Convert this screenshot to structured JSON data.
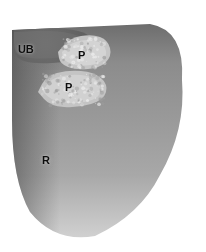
{
  "figure": {
    "domain": "natural-image",
    "kind": "anatomical-histology-section",
    "orientation": "sagittal",
    "color_mode": "grayscale",
    "width_px": 206,
    "height_px": 252,
    "background_color": "#ffffff",
    "border": "none",
    "palette": {
      "background": "#ffffff",
      "soft_tissue_dark": "#5a5a5a",
      "soft_tissue_mid": "#8e8e8e",
      "soft_tissue_light": "#c4c4c4",
      "highlight": "#f2f2f2",
      "cavity_black": "#17181a",
      "label_text": "#0d0d0d"
    },
    "labels": [
      {
        "id": "ub",
        "text": "UB",
        "meaning": "urinary bladder",
        "x_pct": 8.7,
        "y_pct": 17.5,
        "font_size_px": 11
      },
      {
        "id": "p-upper",
        "text": "P",
        "meaning": "prostate (upper zone)",
        "x_pct": 37.9,
        "y_pct": 19.8,
        "font_size_px": 11
      },
      {
        "id": "p-lower",
        "text": "P",
        "meaning": "prostate (lower zone)",
        "x_pct": 31.6,
        "y_pct": 32.5,
        "font_size_px": 11
      },
      {
        "id": "r",
        "text": "R",
        "meaning": "rectum",
        "x_pct": 20.4,
        "y_pct": 61.5,
        "font_size_px": 11
      }
    ]
  }
}
